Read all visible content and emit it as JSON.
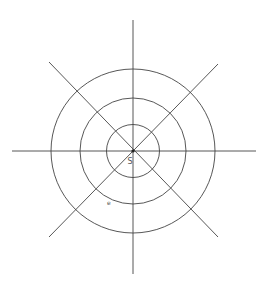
{
  "diagram": {
    "type": "concentric-circles-with-radial-lines",
    "center": {
      "x": 133,
      "y": 151
    },
    "radii": [
      26.5,
      53,
      82
    ],
    "labels": {
      "center": "S",
      "point": "e"
    },
    "line_color": "#444444",
    "point_color": "#222222"
  }
}
